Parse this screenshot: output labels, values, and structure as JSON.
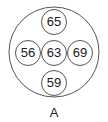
{
  "diagram": {
    "outer": {
      "cx": 54,
      "cy": 52,
      "r": 45
    },
    "nodes": [
      {
        "value": "65",
        "cx": 54,
        "cy": 22
      },
      {
        "value": "56",
        "cx": 28,
        "cy": 53
      },
      {
        "value": "63",
        "cx": 54,
        "cy": 53
      },
      {
        "value": "69",
        "cx": 80,
        "cy": 53
      },
      {
        "value": "59",
        "cx": 54,
        "cy": 83
      }
    ],
    "caption": "A",
    "stroke_color": "#555555"
  }
}
